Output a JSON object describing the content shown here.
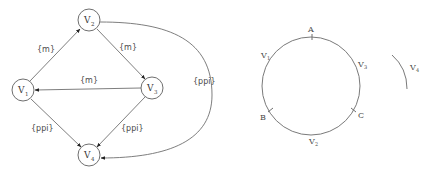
{
  "graph": {
    "nodes": [
      {
        "id": "V1",
        "label": "V",
        "sub": "1",
        "cx": 23,
        "cy": 90
      },
      {
        "id": "V2",
        "label": "V",
        "sub": "2",
        "cx": 89,
        "cy": 20
      },
      {
        "id": "V3",
        "label": "V",
        "sub": "3",
        "cx": 152,
        "cy": 88
      },
      {
        "id": "V4",
        "label": "V",
        "sub": "4",
        "cx": 89,
        "cy": 155
      }
    ],
    "edges": [
      {
        "from": "V1",
        "to": "V2",
        "label": "{m}"
      },
      {
        "from": "V2",
        "to": "V3",
        "label": "{m}"
      },
      {
        "from": "V3",
        "to": "V1",
        "label": "{m}"
      },
      {
        "from": "V1",
        "to": "V4",
        "label": "{ppi}"
      },
      {
        "from": "V3",
        "to": "V4",
        "label": "{ppi}"
      },
      {
        "from": "V2",
        "to": "V4",
        "label": "{ppi}",
        "curved": true
      }
    ]
  },
  "ring": {
    "points": [
      {
        "label": "A",
        "sub": ""
      },
      {
        "label": "B",
        "sub": ""
      },
      {
        "label": "C",
        "sub": ""
      }
    ],
    "arcs": [
      {
        "label": "V",
        "sub": "1"
      },
      {
        "label": "V",
        "sub": "3"
      },
      {
        "label": "V",
        "sub": "2"
      }
    ],
    "detached_arc": {
      "label": "V",
      "sub": "4"
    }
  }
}
